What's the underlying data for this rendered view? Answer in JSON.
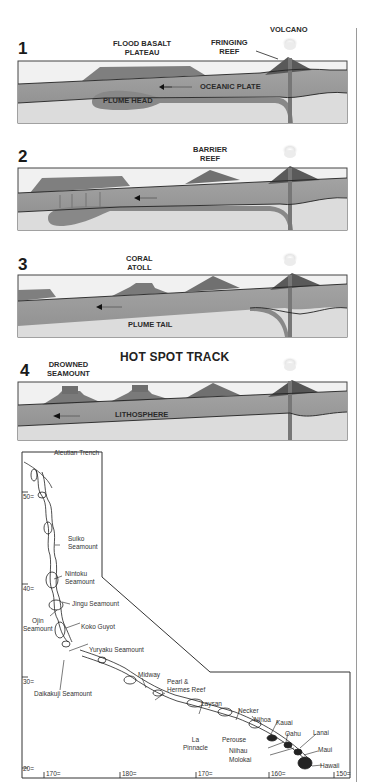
{
  "panels": [
    {
      "number": "1",
      "labels": {
        "flood_basalt": "FLOOD BASALT\nPLATEAU",
        "fringing_reef": "FRINGING\nREEF",
        "volcano": "VOLCANO",
        "oceanic_plate": "OCEANIC PLATE",
        "plume_head": "PLUME HEAD"
      }
    },
    {
      "number": "2",
      "labels": {
        "barrier_reef": "BARRIER\nREEF"
      }
    },
    {
      "number": "3",
      "labels": {
        "coral_atoll": "CORAL\nATOLL",
        "plume_tail": "PLUME TAIL"
      }
    },
    {
      "number": "4",
      "title": "HOT SPOT TRACK",
      "labels": {
        "drowned_seamount": "DROWNED\nSEAMOUNT",
        "lithosphere": "LITHOSPHERE"
      }
    }
  ],
  "map": {
    "labels": {
      "aleutian_trench": "Aleutian Trench",
      "suiko": "Suiko\nSeamount",
      "nintoku": "Nintoku\nSeamount",
      "jingu": "Jingu Seamount",
      "ojin": "Ojin\nSeamount",
      "koko": "Koko Guyot",
      "yuryaku": "Yuryaku Seamount",
      "daikakuji": "Daikakuji Seamount",
      "midway": "Midway",
      "pearl_hermes": "Pearl &\nHermes Reef",
      "laysan": "Laysan",
      "la_pinnacle": "La\nPinnacle",
      "necker": "Necker",
      "nihoa": "Nihoa",
      "perouse": "Perouse",
      "kauai": "Kauai",
      "oahu": "Oahu",
      "lanai": "Lanai",
      "niihau": "Niihau",
      "molokai": "Molokai",
      "maui": "Maui",
      "hawaii": "Hawaii"
    },
    "lat_ticks": [
      "50=",
      "40=",
      "30=",
      "20="
    ],
    "lon_ticks": [
      "170=",
      "180=",
      "170=",
      "160=",
      "150="
    ]
  },
  "colors": {
    "sky": "#f1f1f1",
    "mantle": "#dcdcdc",
    "plate": "#9a9a9a",
    "plume": "#888888",
    "volcano": "#5e5e5e",
    "reef": "#777777",
    "outline": "#333333"
  }
}
